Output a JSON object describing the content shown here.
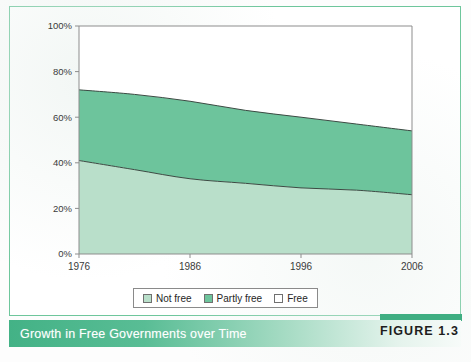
{
  "figure": {
    "caption_title": "Growth in Free Governments over Time",
    "figure_label": "FIGURE 1.3",
    "source_note": ""
  },
  "legend": {
    "entries": [
      {
        "label": "Not free",
        "color": "#b9dfca"
      },
      {
        "label": "Partly free",
        "color": "#6dc49c"
      },
      {
        "label": "Free",
        "color": "#ffffff"
      }
    ]
  },
  "colors": {
    "not_free": "#b9dfca",
    "partly_free": "#6dc49c",
    "free": "#ffffff",
    "frame": "#6ec69c",
    "axis": "#8d8d8d",
    "series_line": "#3c4a43",
    "caption_start": "#43b286",
    "caption_end": "#f7fbf9"
  },
  "chart_data": {
    "type": "area",
    "stacked": true,
    "title": "Growth in Free Governments over Time",
    "xlabel": "",
    "ylabel": "",
    "grid": false,
    "legend_position": "bottom",
    "x": [
      1976,
      1981,
      1986,
      1991,
      1996,
      2001,
      2006
    ],
    "xlim": [
      1976,
      2006
    ],
    "ylim": [
      0,
      100
    ],
    "xticks": [
      "1976",
      "1986",
      "1996",
      "2006"
    ],
    "xtick_values": [
      1976,
      1986,
      1996,
      2006
    ],
    "yticks": [
      "0%",
      "20%",
      "40%",
      "60%",
      "80%",
      "100%"
    ],
    "ytick_values": [
      0,
      20,
      40,
      60,
      80,
      100
    ],
    "series": [
      {
        "name": "Not free",
        "values": [
          41,
          37,
          33,
          31,
          29,
          28,
          26
        ]
      },
      {
        "name": "Partly free",
        "values": [
          31,
          33,
          34,
          32,
          31,
          29,
          28
        ]
      },
      {
        "name": "Free",
        "values": [
          28,
          30,
          33,
          37,
          40,
          43,
          46
        ]
      }
    ],
    "cumulative": [
      {
        "name": "Not free",
        "values": [
          41,
          37,
          33,
          31,
          29,
          28,
          26
        ]
      },
      {
        "name": "Not free + Partly free",
        "values": [
          72,
          70,
          67,
          63,
          60,
          57,
          54
        ]
      }
    ]
  }
}
